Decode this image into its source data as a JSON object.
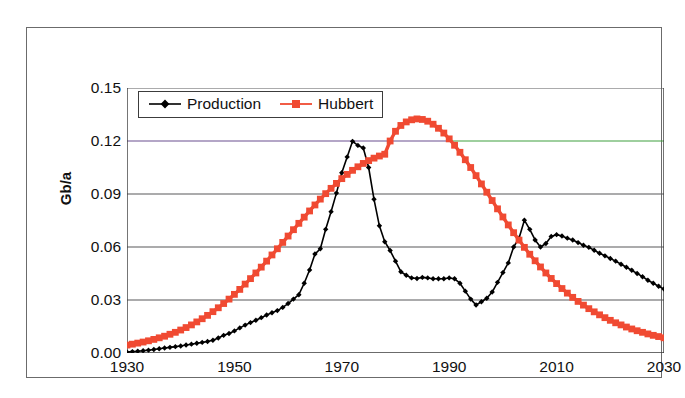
{
  "figure": {
    "y_axis_title": "Gb/a"
  },
  "legend": {
    "entries": [
      {
        "label": "Production",
        "color": "#000000",
        "marker": "diamond-marker"
      },
      {
        "label": "Hubbert",
        "color": "#F04A32",
        "marker": "square-marker"
      }
    ]
  },
  "chart_data": {
    "type": "line",
    "title": "",
    "subtitle": "",
    "xlabel": "",
    "ylabel": "Gb/a",
    "xlim": [
      1930,
      2030
    ],
    "ylim": [
      0.0,
      0.15
    ],
    "xticks": [
      "1930",
      "1950",
      "1970",
      "1990",
      "2010",
      "2030"
    ],
    "xtick_values": [
      1930,
      1950,
      1970,
      1990,
      2010,
      2030
    ],
    "yticks": [
      "0.00",
      "0.03",
      "0.06",
      "0.09",
      "0.12",
      "0.15"
    ],
    "ytick_values": [
      0.0,
      0.03,
      0.06,
      0.09,
      0.12,
      0.15
    ],
    "grid": "horizontal",
    "legend_position": "top-left-inside",
    "x": [
      1930,
      1931,
      1932,
      1933,
      1934,
      1935,
      1936,
      1937,
      1938,
      1939,
      1940,
      1941,
      1942,
      1943,
      1944,
      1945,
      1946,
      1947,
      1948,
      1949,
      1950,
      1951,
      1952,
      1953,
      1954,
      1955,
      1956,
      1957,
      1958,
      1959,
      1960,
      1961,
      1962,
      1963,
      1964,
      1965,
      1966,
      1967,
      1968,
      1969,
      1970,
      1971,
      1972,
      1973,
      1974,
      1975,
      1976,
      1977,
      1978,
      1979,
      1980,
      1981,
      1982,
      1983,
      1984,
      1985,
      1986,
      1987,
      1988,
      1989,
      1990,
      1991,
      1992,
      1993,
      1994,
      1995,
      1996,
      1997,
      1998,
      1999,
      2000,
      2001,
      2002,
      2003,
      2004,
      2005,
      2006,
      2007,
      2008,
      2009,
      2010,
      2011,
      2012,
      2013,
      2014,
      2015,
      2016,
      2017,
      2018,
      2019,
      2020,
      2021,
      2022,
      2023,
      2024,
      2025,
      2026,
      2027,
      2028,
      2029,
      2030
    ],
    "series": [
      {
        "name": "Production",
        "color": "#000000",
        "marker": "diamond-marker",
        "values": [
          0.0005,
          0.0008,
          0.001,
          0.0013,
          0.0016,
          0.002,
          0.0024,
          0.0028,
          0.0032,
          0.0036,
          0.004,
          0.0045,
          0.005,
          0.0055,
          0.006,
          0.0065,
          0.0072,
          0.0085,
          0.01,
          0.011,
          0.0125,
          0.0142,
          0.0158,
          0.0172,
          0.0185,
          0.02,
          0.0215,
          0.0228,
          0.024,
          0.0258,
          0.028,
          0.0305,
          0.033,
          0.0395,
          0.047,
          0.056,
          0.059,
          0.07,
          0.08,
          0.0905,
          0.102,
          0.111,
          0.1198,
          0.1175,
          0.116,
          0.105,
          0.087,
          0.072,
          0.063,
          0.058,
          0.052,
          0.046,
          0.044,
          0.0425,
          0.0422,
          0.0428,
          0.0425,
          0.042,
          0.042,
          0.042,
          0.0425,
          0.042,
          0.0395,
          0.035,
          0.0305,
          0.0272,
          0.029,
          0.031,
          0.0345,
          0.04,
          0.0455,
          0.051,
          0.06,
          0.065,
          0.0752,
          0.07,
          0.064,
          0.06,
          0.062,
          0.066,
          0.067,
          0.0662,
          0.065,
          0.064,
          0.0625,
          0.061,
          0.0598,
          0.0582,
          0.0565,
          0.055,
          0.0535,
          0.052,
          0.0502,
          0.0485,
          0.0468,
          0.045,
          0.0432,
          0.0412,
          0.0395,
          0.0378,
          0.0362
        ]
      },
      {
        "name": "Hubbert",
        "color": "#F04A32",
        "marker": "square-marker",
        "values": [
          0.0045,
          0.005,
          0.0056,
          0.0062,
          0.0069,
          0.0077,
          0.0086,
          0.0095,
          0.0106,
          0.0117,
          0.013,
          0.0144,
          0.0159,
          0.0176,
          0.0194,
          0.0213,
          0.0234,
          0.0256,
          0.028,
          0.0305,
          0.0332,
          0.036,
          0.039,
          0.0421,
          0.0453,
          0.0486,
          0.052,
          0.0555,
          0.059,
          0.0626,
          0.0662,
          0.0698,
          0.0734,
          0.0769,
          0.0804,
          0.0838,
          0.0871,
          0.0902,
          0.0932,
          0.096,
          0.0987,
          0.1011,
          0.1034,
          0.1054,
          0.1073,
          0.1089,
          0.1103,
          0.1115,
          0.1125,
          0.12,
          0.1255,
          0.1288,
          0.1308,
          0.132,
          0.1325,
          0.1322,
          0.1312,
          0.1295,
          0.1272,
          0.1245,
          0.1212,
          0.1176,
          0.1136,
          0.1094,
          0.105,
          0.1004,
          0.0957,
          0.091,
          0.0863,
          0.0816,
          0.077,
          0.0725,
          0.0681,
          0.0639,
          0.0598,
          0.0559,
          0.0522,
          0.0487,
          0.0453,
          0.0422,
          0.0393,
          0.0365,
          0.0339,
          0.0315,
          0.0292,
          0.0271,
          0.0251,
          0.0233,
          0.0216,
          0.02,
          0.0185,
          0.0171,
          0.0159,
          0.0147,
          0.0136,
          0.0126,
          0.0117,
          0.0108,
          0.01,
          0.0093,
          0.0086
        ]
      }
    ]
  },
  "colors": {
    "production": "#000000",
    "hubbert": "#F04A32",
    "gridline": "#59595a",
    "axis": "#3a3a3a",
    "frame": "#6b6b6b",
    "highlight_gridline_left": "#6b4f8f",
    "highlight_gridline_right": "#3fa03f"
  }
}
